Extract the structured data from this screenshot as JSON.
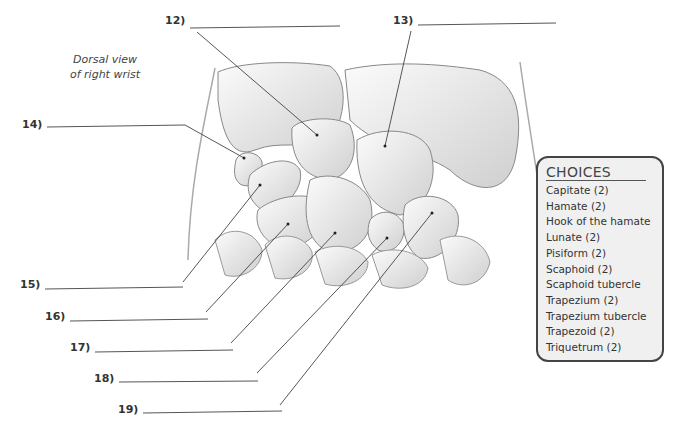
{
  "caption": {
    "line1": "Dorsal view",
    "line2": "of right wrist"
  },
  "labels": [
    {
      "id": "12",
      "text": "12)",
      "x": 165,
      "y": 14,
      "line": [
        190,
        28,
        340,
        26
      ],
      "leader": [
        197,
        32,
        317,
        135
      ]
    },
    {
      "id": "13",
      "text": "13)",
      "x": 393,
      "y": 14,
      "line": [
        418,
        25,
        556,
        23
      ],
      "leader": [
        411,
        31,
        385,
        146
      ]
    },
    {
      "id": "14",
      "text": "14)",
      "x": 22,
      "y": 118,
      "line": [
        47,
        127,
        185,
        125
      ],
      "leader": [
        185,
        125,
        244,
        158
      ]
    },
    {
      "id": "15",
      "text": "15)",
      "x": 20,
      "y": 278,
      "line": [
        45,
        289,
        183,
        287
      ],
      "leader": [
        183,
        282,
        260,
        185
      ]
    },
    {
      "id": "16",
      "text": "16)",
      "x": 45,
      "y": 310,
      "line": [
        70,
        321,
        208,
        319
      ],
      "leader": [
        206,
        312,
        288,
        224
      ]
    },
    {
      "id": "17",
      "text": "17)",
      "x": 70,
      "y": 341,
      "line": [
        95,
        352,
        233,
        350
      ],
      "leader": [
        231,
        343,
        335,
        233
      ]
    },
    {
      "id": "18",
      "text": "18)",
      "x": 94,
      "y": 372,
      "line": [
        119,
        382,
        258,
        381
      ],
      "leader": [
        257,
        373,
        387,
        238
      ]
    },
    {
      "id": "19",
      "text": "19)",
      "x": 118,
      "y": 403,
      "line": [
        143,
        413,
        282,
        411
      ],
      "leader": [
        280,
        405,
        432,
        213
      ]
    }
  ],
  "choices": {
    "title": "CHOICES",
    "items": [
      "Capitate (2)",
      "Hamate (2)",
      "Hook of the hamate",
      "Lunate (2)",
      "Pisiform (2)",
      "Scaphoid (2)",
      "Scaphoid tubercle",
      "Trapezium (2)",
      "Trapezium tubercle",
      "Trapezoid (2)",
      "Triquetrum (2)"
    ]
  },
  "colors": {
    "line": "#555555",
    "bone_fill": "#f4f4f4",
    "bone_stroke": "#888888",
    "box_bg": "#f0f0f0",
    "box_border": "#444444"
  }
}
